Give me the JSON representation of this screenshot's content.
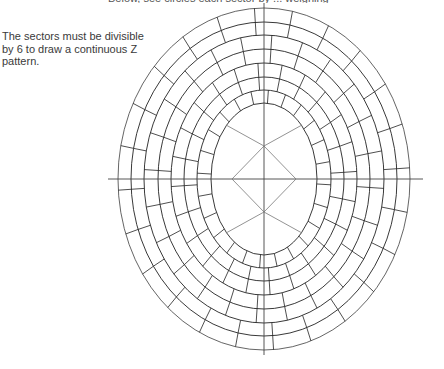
{
  "top_caption": "Below, see circles each sector by ... weighing",
  "side_note": {
    "lines": [
      "The sectors must be divisible",
      "by 6 to draw a continuous Z",
      "pattern."
    ]
  },
  "diagram": {
    "center": [
      264,
      179
    ],
    "ellipses": [
      {
        "rx": 146,
        "ry": 171
      },
      {
        "rx": 133,
        "ry": 157
      },
      {
        "rx": 120,
        "ry": 144
      },
      {
        "rx": 106,
        "ry": 130
      },
      {
        "rx": 93,
        "ry": 116
      },
      {
        "rx": 80,
        "ry": 102
      },
      {
        "rx": 67,
        "ry": 89
      },
      {
        "rx": 53,
        "ry": 76
      }
    ],
    "axes": {
      "h": [
        108,
        423
      ],
      "v": [
        3,
        355
      ]
    },
    "diamond": {
      "half_w": 32,
      "half_h": 33
    },
    "sectors": 24,
    "stroke": "#222222",
    "axis_stroke": "#444444",
    "diamond_stroke": "#777777"
  }
}
